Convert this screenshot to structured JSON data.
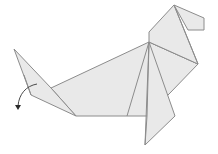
{
  "diagram": {
    "subject": "origami seal",
    "colors": {
      "background": "#ffffff",
      "paper": "#e9e9e9",
      "edge": "#8c8c8c",
      "arrow": "#4a4a4a"
    },
    "parts": [
      {
        "name": "tail",
        "label": "tail"
      },
      {
        "name": "body",
        "label": "body"
      },
      {
        "name": "flipper",
        "label": "front flipper"
      },
      {
        "name": "head",
        "label": "head"
      },
      {
        "name": "snout",
        "label": "snout"
      },
      {
        "name": "fold-arrow",
        "label": "fold arrow"
      }
    ]
  }
}
